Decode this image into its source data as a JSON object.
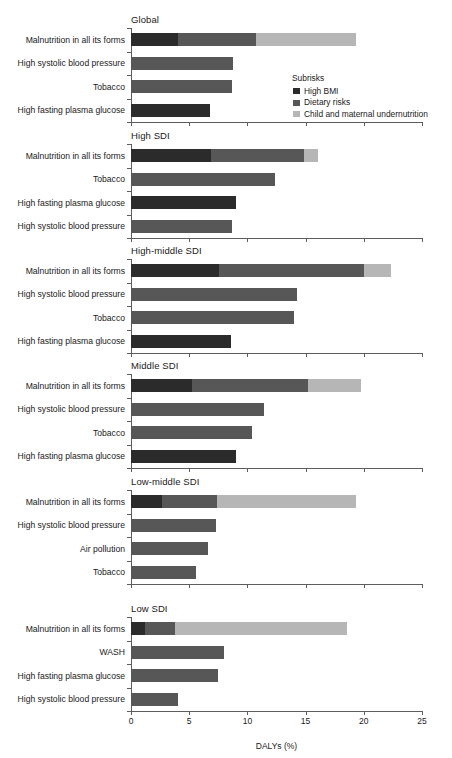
{
  "legend": {
    "title": "Subrisks",
    "items": [
      {
        "label": "High BMI",
        "key": "bmi",
        "color": "#2b2b2b"
      },
      {
        "label": "Dietary risks",
        "key": "diet",
        "color": "#575757"
      },
      {
        "label": "Child and maternal undernutrition",
        "key": "under",
        "color": "#b6b6b6"
      }
    ]
  },
  "chart_data": {
    "type": "bar",
    "title": "",
    "xlabel": "DALYs (%)",
    "ylabel": "",
    "xlim": [
      0,
      25
    ],
    "xticks": [
      0,
      5,
      10,
      15,
      20,
      25
    ],
    "xticklabels": [
      "0",
      "5",
      "10",
      "15",
      "20",
      "25"
    ],
    "grid": false,
    "orientation": "horizontal",
    "stacked": true,
    "legend_position": "inside-upper-right",
    "series": [
      {
        "name": "High BMI",
        "color": "#2b2b2b"
      },
      {
        "name": "Dietary risks",
        "color": "#575757"
      },
      {
        "name": "Child and maternal undernutrition",
        "color": "#b6b6b6"
      }
    ],
    "panels": [
      {
        "title": "Global",
        "categories": [
          "Malnutrition in all its forms",
          "High systolic blood pressure",
          "Tobacco",
          "High fasting plasma glucose"
        ],
        "bars": [
          {
            "category": "Malnutrition in all its forms",
            "segments": [
              {
                "series": "High BMI",
                "value": 4.0
              },
              {
                "series": "Dietary risks",
                "value": 6.7
              },
              {
                "series": "Child and maternal undernutrition",
                "value": 8.6
              }
            ],
            "total": 19.3
          },
          {
            "category": "High systolic blood pressure",
            "segments": [
              {
                "series": "Dietary risks",
                "value": 8.8
              }
            ],
            "total": 8.8
          },
          {
            "category": "Tobacco",
            "segments": [
              {
                "series": "Dietary risks",
                "value": 8.7
              }
            ],
            "total": 8.7
          },
          {
            "category": "High fasting plasma glucose",
            "segments": [
              {
                "series": "High BMI",
                "value": 6.8
              }
            ],
            "total": 6.8
          }
        ]
      },
      {
        "title": "High SDI",
        "categories": [
          "Malnutrition in all its forms",
          "Tobacco",
          "High fasting plasma glucose",
          "High systolic blood pressure"
        ],
        "bars": [
          {
            "category": "Malnutrition in all its forms",
            "segments": [
              {
                "series": "High BMI",
                "value": 6.9
              },
              {
                "series": "Dietary risks",
                "value": 8.0
              },
              {
                "series": "Child and maternal undernutrition",
                "value": 1.2
              }
            ],
            "total": 16.1
          },
          {
            "category": "Tobacco",
            "segments": [
              {
                "series": "Dietary risks",
                "value": 12.4
              }
            ],
            "total": 12.4
          },
          {
            "category": "High fasting plasma glucose",
            "segments": [
              {
                "series": "High BMI",
                "value": 9.0
              }
            ],
            "total": 9.0
          },
          {
            "category": "High systolic blood pressure",
            "segments": [
              {
                "series": "Dietary risks",
                "value": 8.7
              }
            ],
            "total": 8.7
          }
        ]
      },
      {
        "title": "High-middle SDI",
        "categories": [
          "Malnutrition in all its forms",
          "High systolic blood pressure",
          "Tobacco",
          "High fasting plasma glucose"
        ],
        "bars": [
          {
            "category": "Malnutrition in all its forms",
            "segments": [
              {
                "series": "High BMI",
                "value": 7.6
              },
              {
                "series": "Dietary risks",
                "value": 12.4
              },
              {
                "series": "Child and maternal undernutrition",
                "value": 2.3
              }
            ],
            "total": 22.3
          },
          {
            "category": "High systolic blood pressure",
            "segments": [
              {
                "series": "Dietary risks",
                "value": 14.3
              }
            ],
            "total": 14.3
          },
          {
            "category": "Tobacco",
            "segments": [
              {
                "series": "Dietary risks",
                "value": 14.0
              }
            ],
            "total": 14.0
          },
          {
            "category": "High fasting plasma glucose",
            "segments": [
              {
                "series": "High BMI",
                "value": 8.6
              }
            ],
            "total": 8.6
          }
        ]
      },
      {
        "title": "Middle SDI",
        "categories": [
          "Malnutrition in all its forms",
          "High systolic blood pressure",
          "Tobacco",
          "High fasting plasma glucose"
        ],
        "bars": [
          {
            "category": "Malnutrition in all its forms",
            "segments": [
              {
                "series": "High BMI",
                "value": 5.2
              },
              {
                "series": "Dietary risks",
                "value": 10.0
              },
              {
                "series": "Child and maternal undernutrition",
                "value": 4.6
              }
            ],
            "total": 19.8
          },
          {
            "category": "High systolic blood pressure",
            "segments": [
              {
                "series": "Dietary risks",
                "value": 11.4
              }
            ],
            "total": 11.4
          },
          {
            "category": "Tobacco",
            "segments": [
              {
                "series": "Dietary risks",
                "value": 10.4
              }
            ],
            "total": 10.4
          },
          {
            "category": "High fasting plasma glucose",
            "segments": [
              {
                "series": "High BMI",
                "value": 9.0
              }
            ],
            "total": 9.0
          }
        ]
      },
      {
        "title": "Low-middle SDI",
        "categories": [
          "Malnutrition in all its forms",
          "High systolic blood pressure",
          "Air pollution",
          "Tobacco"
        ],
        "bars": [
          {
            "category": "Malnutrition in all its forms",
            "segments": [
              {
                "series": "High BMI",
                "value": 2.7
              },
              {
                "series": "Dietary risks",
                "value": 4.7
              },
              {
                "series": "Child and maternal undernutrition",
                "value": 11.9
              }
            ],
            "total": 19.3
          },
          {
            "category": "High systolic blood pressure",
            "segments": [
              {
                "series": "Dietary risks",
                "value": 7.3
              }
            ],
            "total": 7.3
          },
          {
            "category": "Air pollution",
            "segments": [
              {
                "series": "Dietary risks",
                "value": 6.6
              }
            ],
            "total": 6.6
          },
          {
            "category": "Tobacco",
            "segments": [
              {
                "series": "Dietary risks",
                "value": 5.6
              }
            ],
            "total": 5.6
          }
        ]
      },
      {
        "title": "Low SDI",
        "categories": [
          "Malnutrition in all its forms",
          "WASH",
          "High fasting plasma glucose",
          "High systolic blood pressure"
        ],
        "bars": [
          {
            "category": "Malnutrition in all its forms",
            "segments": [
              {
                "series": "High BMI",
                "value": 1.2
              },
              {
                "series": "Dietary risks",
                "value": 2.6
              },
              {
                "series": "Child and maternal undernutrition",
                "value": 14.8
              }
            ],
            "total": 18.6
          },
          {
            "category": "WASH",
            "segments": [
              {
                "series": "Dietary risks",
                "value": 8.0
              }
            ],
            "total": 8.0
          },
          {
            "category": "High fasting plasma glucose",
            "segments": [
              {
                "series": "Dietary risks",
                "value": 7.5
              }
            ],
            "total": 7.5
          },
          {
            "category": "High systolic blood pressure",
            "segments": [
              {
                "series": "Dietary risks",
                "value": 4.0
              }
            ],
            "total": 4.0
          }
        ]
      }
    ]
  }
}
